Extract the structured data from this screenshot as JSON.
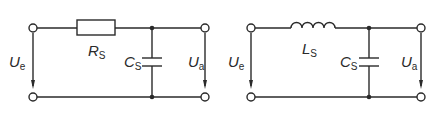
{
  "circuits": [
    {
      "name": "rc-lowpass",
      "series_element": "resistor",
      "series_label": {
        "main": "R",
        "sub": "S"
      },
      "shunt_label": {
        "main": "C",
        "sub": "S"
      },
      "input_label": {
        "main": "U",
        "sub": "e"
      },
      "output_label": {
        "main": "U",
        "sub": "a"
      }
    },
    {
      "name": "lc-lowpass",
      "series_element": "inductor",
      "series_label": {
        "main": "L",
        "sub": "S"
      },
      "shunt_label": {
        "main": "C",
        "sub": "S"
      },
      "input_label": {
        "main": "U",
        "sub": "e"
      },
      "output_label": {
        "main": "U",
        "sub": "a"
      }
    }
  ],
  "colors": {
    "line": "#2a2a2a",
    "background": "#ffffff"
  }
}
